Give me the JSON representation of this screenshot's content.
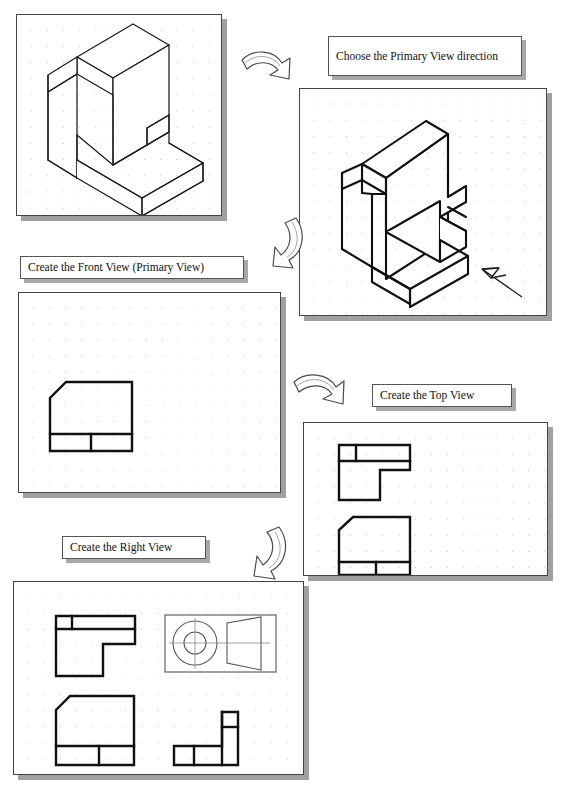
{
  "document": {
    "title": "Orthographic Projection Steps",
    "background_color": "#ffffff",
    "ink_color": "#1a1a1a",
    "grid_dot_color": "#bdbdbd",
    "shadow_color": "#a0a0a0"
  },
  "captions": [
    {
      "id": "choose-primary-view",
      "text": "Choose the Primary View direction",
      "line1": "Choose the Primary View",
      "line2": "direction"
    },
    {
      "id": "create-front-view",
      "text": "Create the Front View (Primary View)"
    },
    {
      "id": "create-top-view",
      "text": "Create the Top View"
    },
    {
      "id": "create-right-view",
      "text": "Create the Right View"
    }
  ],
  "panels": [
    {
      "id": "panel-isometric-1",
      "label": "isometric pictorial of part",
      "step": 1,
      "has_grid": true,
      "has_arrow_marker": false
    },
    {
      "id": "panel-isometric-2",
      "label": "isometric pictorial with view direction arrow",
      "step": 2,
      "has_grid": true,
      "has_arrow_marker": true
    },
    {
      "id": "panel-front-view",
      "label": "sheet with front view drawn",
      "step": 3,
      "has_grid": true,
      "views": [
        "front"
      ]
    },
    {
      "id": "panel-top-view",
      "label": "sheet with top and front views drawn",
      "step": 4,
      "has_grid": true,
      "views": [
        "top",
        "front"
      ]
    },
    {
      "id": "panel-all-views",
      "label": "sheet with top, front and right views plus detail box",
      "step": 5,
      "has_grid": true,
      "views": [
        "top",
        "front",
        "right",
        "detail"
      ]
    }
  ],
  "arrows": [
    {
      "id": "arrow-1",
      "direction": "right-down",
      "from": "panel-isometric-1",
      "to": "panel-isometric-2"
    },
    {
      "id": "arrow-2",
      "direction": "down-left",
      "from": "panel-isometric-1",
      "to": "panel-front-view"
    },
    {
      "id": "arrow-3",
      "direction": "right-down",
      "from": "panel-front-view",
      "to": "panel-top-view"
    },
    {
      "id": "arrow-4",
      "direction": "down-left",
      "from": "panel-top-view",
      "to": "panel-all-views"
    }
  ],
  "detail_box": {
    "id": "detail-orthographic-sample",
    "shapes": [
      "outer-circle",
      "inner-circle",
      "trapezoid"
    ],
    "centerlines": true
  }
}
